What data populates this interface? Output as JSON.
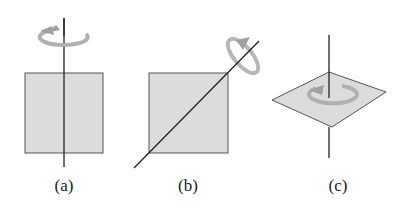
{
  "figure": {
    "panels": [
      {
        "id": "a",
        "label": "(a)",
        "description": "square plate rotating about vertical axis through its center, in its plane"
      },
      {
        "id": "b",
        "label": "(b)",
        "description": "square plate rotating about diagonal axis"
      },
      {
        "id": "c",
        "label": "(c)",
        "description": "square plate rotating about axis perpendicular to its plane"
      }
    ],
    "colors": {
      "plate_fill": "#dcdcdc",
      "plate_edge": "#555555",
      "axis": "#222222",
      "arrow": "#a9a9a9"
    }
  }
}
